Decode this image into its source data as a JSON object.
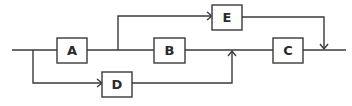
{
  "diagram": {
    "type": "block-diagram",
    "colors": {
      "stroke": "#3a3a3a",
      "text": "#2a2a2a",
      "background": "#ffffff"
    },
    "nodes": [
      {
        "id": "A",
        "label": "A"
      },
      {
        "id": "B",
        "label": "B"
      },
      {
        "id": "C",
        "label": "C"
      },
      {
        "id": "D",
        "label": "D"
      },
      {
        "id": "E",
        "label": "E"
      }
    ],
    "edges": [
      {
        "from": "input",
        "to": "A"
      },
      {
        "from": "input",
        "to": "D"
      },
      {
        "from": "A",
        "to": "B"
      },
      {
        "from": "A",
        "to": "E"
      },
      {
        "from": "B",
        "to": "C"
      },
      {
        "from": "D",
        "to": "B-C junction"
      },
      {
        "from": "C",
        "to": "output"
      },
      {
        "from": "E",
        "to": "output junction"
      }
    ]
  }
}
